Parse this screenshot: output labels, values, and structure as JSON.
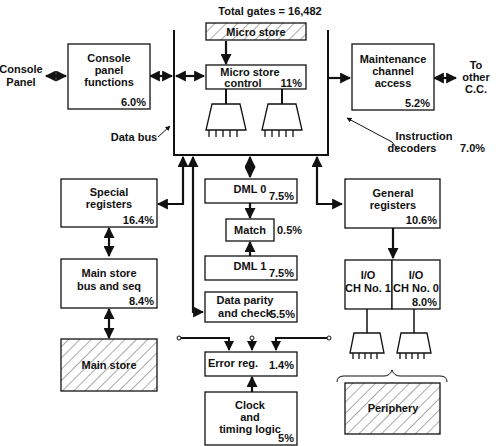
{
  "title": "Total gates = 16,482",
  "external": {
    "console_panel": [
      "Console",
      "Panel"
    ],
    "to_other_cc": [
      "To",
      "other",
      "C.C."
    ]
  },
  "labels": {
    "data_bus": "Data bus",
    "instruction_decoders": [
      "Instruction",
      "decoders"
    ],
    "instruction_decoders_pct": "7.0%"
  },
  "blocks": {
    "console_panel_functions": {
      "lines": [
        "Console",
        "panel",
        "functions"
      ],
      "pct": "6.0%"
    },
    "micro_store": {
      "lines": [
        "Micro store"
      ],
      "pct": ""
    },
    "micro_store_control": {
      "lines": [
        "Micro store",
        "control"
      ],
      "pct": "11%"
    },
    "maintenance_channel_access": {
      "lines": [
        "Maintenance",
        "channel",
        "access"
      ],
      "pct": "5.2%"
    },
    "special_registers": {
      "lines": [
        "Special",
        "registers"
      ],
      "pct": "16.4%"
    },
    "main_store_bus_seq": {
      "lines": [
        "Main store",
        "bus and seq"
      ],
      "pct": "8.4%"
    },
    "main_store": {
      "lines": [
        "Main store"
      ],
      "pct": ""
    },
    "dml0": {
      "lines": [
        "DML 0"
      ],
      "pct": "7.5%"
    },
    "match": {
      "lines": [
        "Match"
      ],
      "pct": "0.5%"
    },
    "dml1": {
      "lines": [
        "DML 1"
      ],
      "pct": "7.5%"
    },
    "data_parity": {
      "lines": [
        "Data parity",
        "and check"
      ],
      "pct": "5.5%"
    },
    "error_reg": {
      "lines": [
        "Error reg."
      ],
      "pct": "1.4%"
    },
    "clock_timing": {
      "lines": [
        "Clock",
        "and",
        "timing logic"
      ],
      "pct": "5%"
    },
    "general_registers": {
      "lines": [
        "General",
        "registers"
      ],
      "pct": "10.6%"
    },
    "io_ch1": {
      "lines": [
        "I/O",
        "CH No. 1"
      ],
      "pct": ""
    },
    "io_ch0": {
      "lines": [
        "I/O",
        "CH No. 0"
      ],
      "pct": "8.0%"
    },
    "periphery": {
      "lines": [
        "Periphery"
      ],
      "pct": ""
    }
  }
}
